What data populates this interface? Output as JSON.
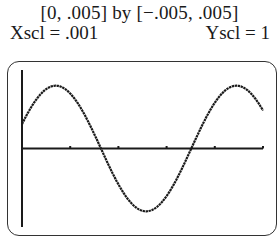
{
  "header": {
    "window": "[0, .005] by [−.005, .005]",
    "xscl": "Xscl = .001",
    "yscl": "Yscl = 1"
  },
  "colors": {
    "curve": "#1a1a1a",
    "axis": "#1a1a1a",
    "frame": "#333333",
    "background": "#ffffff"
  },
  "chart_data": {
    "type": "line",
    "xlabel": "",
    "ylabel": "",
    "xlim": [
      0,
      0.005
    ],
    "ylim": [
      -0.005,
      0.005
    ],
    "xscl": 0.001,
    "yscl": 1,
    "grid": false,
    "legend": null,
    "series": [
      {
        "name": "y = f(x) (sinusoid)",
        "x": [
          0,
          0.0005,
          0.0007,
          0.001,
          0.0015,
          0.0016,
          0.002,
          0.0025,
          0.0026,
          0.003,
          0.0035,
          0.0045,
          0.005
        ],
        "y": [
          0.002,
          0.0038,
          0.004,
          0.0035,
          0.0003,
          0,
          -0.0025,
          -0.004,
          -0.004,
          -0.003,
          0,
          0.004,
          0.0029
        ]
      }
    ],
    "annotations": {
      "peaks_x": [
        0.0007,
        0.00445
      ],
      "trough_x": 0.0026,
      "zero_crossings_x": [
        0.00164,
        0.00352
      ],
      "amplitude": 0.004,
      "period": 0.00375
    }
  }
}
